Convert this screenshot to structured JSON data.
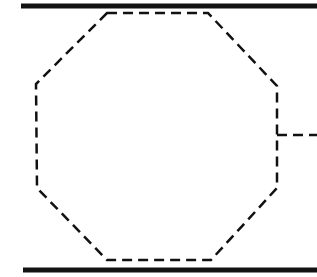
{
  "diagram": {
    "background": "#ffffff",
    "stroke_color": "#111111",
    "top_bar": {
      "x1": 21,
      "y1": 6,
      "x2": 317,
      "y2": 6,
      "width": 5
    },
    "bottom_bar": {
      "x1": 23,
      "y1": 270,
      "x2": 317,
      "y2": 270,
      "width": 5
    },
    "octagon": {
      "points": "107,13 208,13 277,86 277,188 211,260 107,260 37,188 36,84",
      "dash": "10,6",
      "width": 2.5
    },
    "connector": {
      "x1": 277,
      "y1": 135,
      "x2": 317,
      "y2": 135,
      "dash": "10,6",
      "width": 2.5
    }
  }
}
